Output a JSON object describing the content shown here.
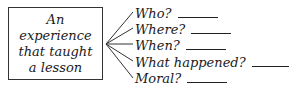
{
  "topic": {
    "text": "An experience that taught a lesson"
  },
  "questions": [
    {
      "label": "Who?",
      "blank_width": 40
    },
    {
      "label": "Where?",
      "blank_width": 40
    },
    {
      "label": "When?",
      "blank_width": 40
    },
    {
      "label": "What happened?",
      "blank_width": 42
    },
    {
      "label": "Moral?",
      "blank_width": 40
    }
  ]
}
